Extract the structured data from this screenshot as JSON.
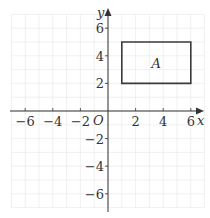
{
  "diagram": {
    "type": "coordinate-grid",
    "axes": {
      "x_label": "x",
      "y_label": "y",
      "origin_label": "O",
      "x_range": [
        -7,
        7
      ],
      "y_range": [
        -7,
        7
      ],
      "x_ticks": [
        {
          "value": -6,
          "label": "−6"
        },
        {
          "value": -4,
          "label": "−4"
        },
        {
          "value": -2,
          "label": "−2"
        },
        {
          "value": 2,
          "label": "2"
        },
        {
          "value": 4,
          "label": "4"
        },
        {
          "value": 6,
          "label": "6"
        }
      ],
      "y_ticks": [
        {
          "value": 6,
          "label": "6"
        },
        {
          "value": 4,
          "label": "4"
        },
        {
          "value": 2,
          "label": "2"
        },
        {
          "value": -2,
          "label": "−2"
        },
        {
          "value": -4,
          "label": "−4"
        },
        {
          "value": -6,
          "label": "−6"
        }
      ]
    },
    "shapes": [
      {
        "name": "A",
        "label": "A",
        "kind": "rectangle",
        "vertices": [
          [
            1,
            2
          ],
          [
            6,
            2
          ],
          [
            6,
            5
          ],
          [
            1,
            5
          ]
        ]
      }
    ],
    "colors": {
      "grid": "#e6e6e6",
      "axis": "#333333",
      "shape": "#3a3a3a"
    }
  }
}
